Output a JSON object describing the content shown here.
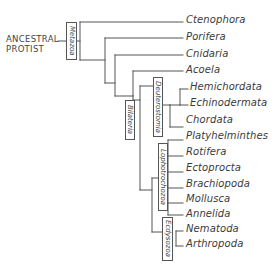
{
  "diagram": {
    "type": "phylogenetic-tree",
    "root": "ANCESTRAL\nPROTIST",
    "root_lines": [
      "ANCESTRAL",
      "PROTIST"
    ],
    "clades": {
      "metazoa": "Metazoa",
      "bilateria": "Bilateria",
      "deuterostomia": "Deuterostomia",
      "lophotrochozoa": "Lophotrochozoa",
      "ecdysozoa": "Ecdysozoa"
    },
    "taxa": [
      "Ctenophora",
      "Porifera",
      "Cnidaria",
      "Acoela",
      "Hemichordata",
      "Echinodermata",
      "Chordata",
      "Platyhelminthes",
      "Rotifera",
      "Ectoprocta",
      "Brachiopoda",
      "Mollusca",
      "Annelida",
      "Nematoda",
      "Arthropoda"
    ],
    "line_color": "#555555"
  }
}
